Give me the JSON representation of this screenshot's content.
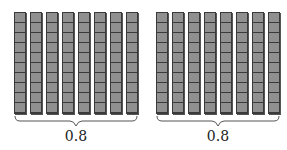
{
  "diagram": {
    "groups": [
      {
        "rods": 8,
        "cubes_per_rod": 10,
        "label": "0.8"
      },
      {
        "rods": 8,
        "cubes_per_rod": 10,
        "label": "0.8"
      }
    ],
    "colors": {
      "rod_fill": "#909090",
      "rod_border": "#3a3a3a",
      "brace": "#555555"
    }
  }
}
